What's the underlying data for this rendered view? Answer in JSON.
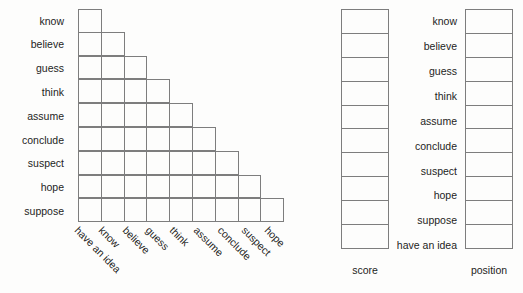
{
  "figure": {
    "title": "",
    "background_color": "#fdfdfc",
    "grid_line_color": "#7d7d7d",
    "text_color": "#1d1d1a"
  },
  "triangle_matrix": {
    "row_labels": [
      "know",
      "believe",
      "guess",
      "think",
      "assume",
      "conclude",
      "suspect",
      "hope",
      "suppose"
    ],
    "column_labels": [
      "have an idea",
      "know",
      "believe",
      "guess",
      "think",
      "assume",
      "conclude",
      "suspect",
      "hope"
    ],
    "row_cell_counts": [
      1,
      2,
      3,
      4,
      5,
      6,
      7,
      8,
      9
    ],
    "cell_values": [
      [
        "",
        "",
        "",
        "",
        "",
        "",
        "",
        "",
        ""
      ],
      [
        "",
        "",
        "",
        "",
        "",
        "",
        "",
        "",
        ""
      ],
      [
        "",
        "",
        "",
        "",
        "",
        "",
        "",
        "",
        ""
      ],
      [
        "",
        "",
        "",
        "",
        "",
        "",
        "",
        "",
        ""
      ],
      [
        "",
        "",
        "",
        "",
        "",
        "",
        "",
        "",
        ""
      ],
      [
        "",
        "",
        "",
        "",
        "",
        "",
        "",
        "",
        ""
      ],
      [
        "",
        "",
        "",
        "",
        "",
        "",
        "",
        "",
        ""
      ],
      [
        "",
        "",
        "",
        "",
        "",
        "",
        "",
        "",
        ""
      ],
      [
        "",
        "",
        "",
        "",
        "",
        "",
        "",
        "",
        ""
      ]
    ]
  },
  "score_column": {
    "caption": "score",
    "cells": [
      "",
      "",
      "",
      "",
      "",
      "",
      "",
      "",
      "",
      ""
    ]
  },
  "word_list": {
    "words": [
      "know",
      "believe",
      "guess",
      "think",
      "assume",
      "conclude",
      "suspect",
      "hope",
      "suppose",
      "have an idea"
    ]
  },
  "position_column": {
    "caption": "position",
    "cells": [
      "",
      "",
      "",
      "",
      "",
      "",
      "",
      "",
      "",
      ""
    ]
  }
}
